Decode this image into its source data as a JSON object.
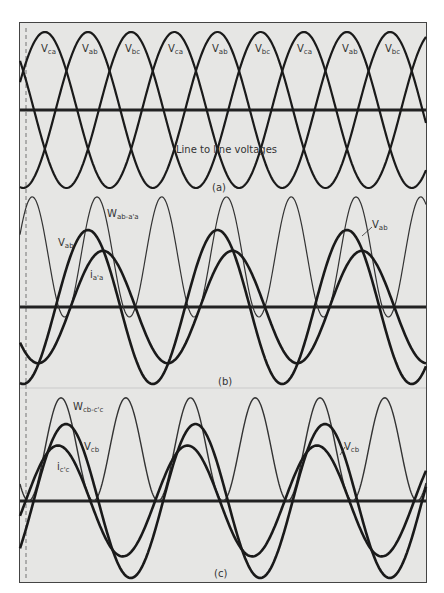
{
  "figure": {
    "panels": [
      {
        "id": "a",
        "label": "(a)",
        "caption": "Line to line voltages",
        "trace_labels": [
          "V_ca",
          "V_ab",
          "V_bc",
          "V_ca",
          "V_ab",
          "V_bc",
          "V_ca",
          "V_ab",
          "V_bc"
        ]
      },
      {
        "id": "b",
        "label": "(b)",
        "trace_labels": [
          "W_ab-a'a",
          "V_ab",
          "i_a'a",
          "V_ab"
        ]
      },
      {
        "id": "c",
        "label": "(c)",
        "trace_labels": [
          "W_cb-c'c",
          "V_cb",
          "i_c'c",
          "V_cb"
        ]
      }
    ]
  },
  "chart_data": [
    {
      "type": "line",
      "title": "(a) Line to line voltages",
      "xlabel": "time",
      "ylabel": "voltage",
      "grid": false,
      "units": "relative (oscillogram)",
      "x_period_cycles_shown": 3,
      "series": [
        {
          "name": "V_ab",
          "amplitude": 1.0,
          "phase_deg": 0
        },
        {
          "name": "V_bc",
          "amplitude": 1.0,
          "phase_deg": -120
        },
        {
          "name": "V_ca",
          "amplitude": 1.0,
          "phase_deg": 120
        }
      ],
      "annotations": [
        "V_ca",
        "V_ab",
        "V_bc",
        "Line to line voltages"
      ]
    },
    {
      "type": "line",
      "title": "(b)",
      "xlabel": "time",
      "ylabel": "",
      "grid": false,
      "x_period_cycles_shown": 3,
      "series": [
        {
          "name": "V_ab",
          "amplitude": 1.0,
          "phase_deg": 0
        },
        {
          "name": "i_a'a",
          "amplitude": 0.73,
          "phase_deg": -30
        },
        {
          "name": "W_ab-a'a",
          "amplitude": 0.78,
          "offset": 0.65,
          "frequency_multiple": 2
        }
      ],
      "annotations": [
        "W_ab-a'a",
        "V_ab",
        "i_a'a"
      ]
    },
    {
      "type": "line",
      "title": "(c)",
      "xlabel": "time",
      "ylabel": "",
      "grid": false,
      "x_period_cycles_shown": 3,
      "series": [
        {
          "name": "V_cb",
          "amplitude": 1.0,
          "phase_deg": 0
        },
        {
          "name": "i_c'c",
          "amplitude": 0.72,
          "phase_deg": 30
        },
        {
          "name": "W_cb-c'c",
          "amplitude": 0.67,
          "offset": 0.67,
          "frequency_multiple": 2
        }
      ],
      "annotations": [
        "W_cb-c'c",
        "V_cb",
        "i_c'c"
      ]
    }
  ]
}
